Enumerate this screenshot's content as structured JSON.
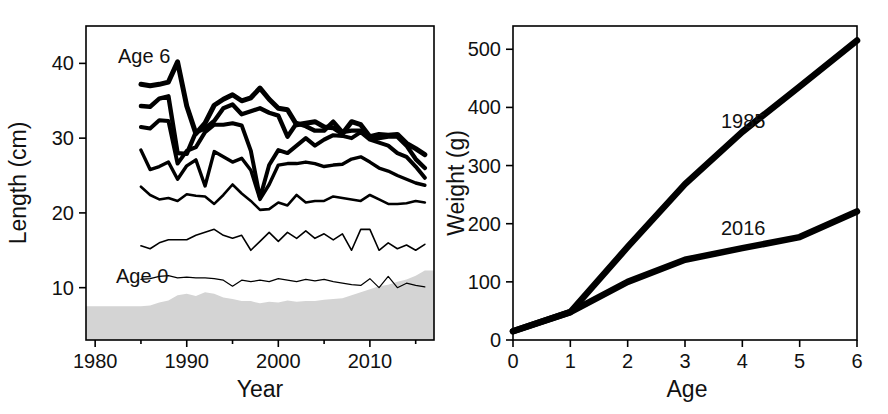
{
  "figure": {
    "panels": [
      "length-at-age-timeseries",
      "weight-at-age-comparison"
    ]
  },
  "chart_data": [
    {
      "id": "left",
      "type": "line",
      "title": "",
      "xlabel": "Year",
      "ylabel": "Length (cm)",
      "xlim": [
        1979,
        2017
      ],
      "ylim": [
        3,
        45
      ],
      "xticks": [
        1980,
        1990,
        2000,
        2010
      ],
      "xticklabels": [
        "1980",
        "1990",
        "2000",
        "2010"
      ],
      "xminorticks": [
        1985,
        1995,
        2005,
        2015
      ],
      "yticks": [
        10,
        20,
        30,
        40
      ],
      "yticklabels": [
        "10",
        "20",
        "30",
        "40"
      ],
      "grid": false,
      "legend": "inline-annotation",
      "annotations": [
        {
          "text": "Age 6",
          "x": 1987.5,
          "y": 42.5
        },
        {
          "text": "Age 0",
          "x": 1987.0,
          "y": 13.0
        }
      ],
      "x": [
        1985,
        1986,
        1987,
        1988,
        1989,
        1990,
        1991,
        1992,
        1993,
        1994,
        1995,
        1996,
        1997,
        1998,
        1999,
        2000,
        2001,
        2002,
        2003,
        2004,
        2005,
        2006,
        2007,
        2008,
        2009,
        2010,
        2011,
        2012,
        2013,
        2014,
        2015,
        2016
      ],
      "series": [
        {
          "name": "Age 6",
          "linewidth": 5.0,
          "values": [
            37.2,
            37.0,
            37.2,
            37.5,
            40.2,
            34.3,
            30.6,
            32.0,
            34.4,
            35.2,
            35.8,
            35.0,
            35.4,
            36.7,
            35.2,
            34.0,
            33.8,
            31.8,
            32.0,
            32.2,
            31.5,
            31.4,
            30.6,
            32.2,
            31.8,
            30.2,
            30.5,
            30.4,
            30.5,
            29.3,
            28.6,
            27.8
          ]
        },
        {
          "name": "Age 5",
          "linewidth": 4.4,
          "values": [
            34.3,
            34.2,
            35.3,
            35.6,
            28.0,
            27.9,
            30.8,
            31.3,
            32.3,
            34.0,
            34.5,
            33.2,
            33.6,
            34.0,
            33.4,
            33.0,
            30.2,
            32.0,
            31.6,
            31.0,
            31.0,
            32.2,
            30.8,
            31.0,
            31.0,
            30.0,
            30.0,
            30.2,
            30.2,
            29.0,
            27.2,
            26.0
          ]
        },
        {
          "name": "Age 4",
          "linewidth": 4.0,
          "values": [
            31.5,
            31.3,
            32.4,
            32.3,
            26.6,
            28.3,
            28.8,
            30.8,
            31.8,
            31.8,
            32.0,
            31.7,
            28.3,
            22.0,
            26.4,
            28.4,
            28.0,
            29.0,
            30.0,
            29.0,
            29.8,
            30.4,
            30.3,
            30.0,
            30.8,
            29.8,
            29.4,
            29.0,
            28.0,
            27.5,
            26.2,
            24.7
          ]
        },
        {
          "name": "Age 3",
          "linewidth": 3.4,
          "values": [
            28.4,
            25.8,
            26.2,
            26.8,
            24.5,
            26.3,
            27.1,
            23.6,
            28.2,
            27.5,
            26.8,
            27.3,
            25.7,
            21.8,
            23.8,
            26.4,
            26.6,
            26.6,
            26.8,
            26.6,
            26.2,
            26.4,
            26.5,
            27.2,
            27.5,
            26.8,
            26.0,
            25.6,
            25.0,
            24.5,
            24.0,
            23.7
          ]
        },
        {
          "name": "Age 2",
          "linewidth": 2.6,
          "values": [
            23.5,
            22.4,
            21.8,
            22.0,
            21.6,
            22.5,
            22.3,
            22.2,
            21.2,
            22.4,
            23.8,
            22.6,
            21.6,
            20.4,
            20.5,
            21.4,
            21.0,
            22.4,
            21.4,
            21.6,
            21.6,
            22.2,
            22.0,
            21.8,
            21.6,
            22.4,
            21.8,
            21.2,
            21.2,
            21.3,
            21.6,
            21.4
          ]
        },
        {
          "name": "Age 1",
          "linewidth": 1.6,
          "values": [
            15.6,
            15.2,
            16.0,
            16.4,
            16.4,
            16.4,
            17.0,
            17.4,
            17.8,
            17.0,
            16.6,
            17.0,
            15.0,
            16.2,
            17.4,
            16.2,
            17.4,
            16.6,
            17.6,
            16.6,
            17.2,
            16.4,
            17.2,
            15.0,
            17.8,
            17.8,
            15.0,
            16.0,
            15.2,
            15.7,
            15.0,
            15.8
          ]
        },
        {
          "name": "Age 0",
          "linewidth": 1.2,
          "values": [
            11.1,
            11.2,
            11.5,
            11.6,
            11.3,
            11.4,
            11.3,
            11.3,
            11.2,
            11.0,
            10.2,
            11.0,
            10.8,
            11.0,
            10.8,
            11.2,
            11.0,
            10.8,
            11.1,
            10.9,
            11.1,
            10.8,
            10.6,
            10.4,
            10.3,
            11.2,
            10.0,
            11.5,
            10.0,
            10.6,
            10.3,
            10.1
          ]
        }
      ],
      "shaded_band": {
        "name": "background-shading",
        "color": "#d4d4d4",
        "upper": [
          7.5,
          7.6,
          8.0,
          8.3,
          9.0,
          9.2,
          8.9,
          9.4,
          9.2,
          8.7,
          8.5,
          8.2,
          8.2,
          7.9,
          8.1,
          8.0,
          8.3,
          8.1,
          8.2,
          8.2,
          8.4,
          8.5,
          8.6,
          9.0,
          9.4,
          9.8,
          10.2,
          10.4,
          10.8,
          11.1,
          11.6,
          12.3
        ],
        "lower": 3
      }
    },
    {
      "id": "right",
      "type": "line",
      "title": "",
      "xlabel": "Age",
      "ylabel": "Weight (g)",
      "xlim": [
        0,
        6
      ],
      "ylim": [
        0,
        540
      ],
      "xticks": [
        0,
        1,
        2,
        3,
        4,
        5,
        6
      ],
      "xticklabels": [
        "0",
        "1",
        "2",
        "3",
        "4",
        "5",
        "6"
      ],
      "yticks": [
        0,
        100,
        200,
        300,
        400,
        500
      ],
      "yticklabels": [
        "0",
        "100",
        "200",
        "300",
        "400",
        "500"
      ],
      "grid": false,
      "legend": "inline-annotation",
      "annotations": [
        {
          "text": "1985",
          "x": 3.55,
          "y": 392
        },
        {
          "text": "2016",
          "x": 3.55,
          "y": 205
        }
      ],
      "x": [
        0,
        1,
        2,
        3,
        4,
        5,
        6
      ],
      "series": [
        {
          "name": "1985",
          "linewidth": 6.5,
          "values": [
            15,
            48,
            160,
            268,
            358,
            436,
            515
          ]
        },
        {
          "name": "2016",
          "linewidth": 6.5,
          "values": [
            15,
            48,
            100,
            138,
            158,
            177,
            221
          ]
        }
      ]
    }
  ]
}
